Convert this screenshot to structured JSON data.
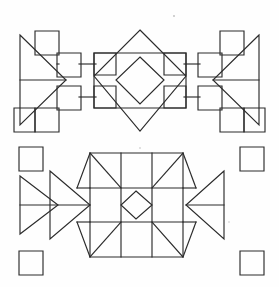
{
  "document": {
    "title": "Geometric Quilt Block Patterns",
    "width": 279,
    "height": 287,
    "background_color": "#fefefe",
    "ink_color": "#2b2b2b",
    "description": "Two line-drawn symmetric quilt block patterns stacked vertically on a plain white ground."
  },
  "figures": [
    {
      "id": "upper-block",
      "name": "Diamond-in-Square Block with Square Chains and Side Triangles",
      "symmetry": "bilateral left-right, bilateral top-bottom",
      "elements": [
        "central large diamond rotated square",
        "inner concentric diamond",
        "four corner squares of central panel",
        "ascending and descending chains of small squares on both flanks",
        "right-pointing triangle with horizontal midline at far left",
        "left-pointing triangle with horizontal midline at far right",
        "horizontal connector bars at upper and lower midlines"
      ]
    },
    {
      "id": "lower-block",
      "name": "Nine-Patch Star Block with Small Center Diamond",
      "symmetry": "bilateral left-right, bilateral top-bottom",
      "elements": [
        "three by three grid of square cells",
        "small diamond centered in middle cell",
        "diagonal lines across the four corner cells forming star points",
        "two nested right-pointing triangles at far left",
        "one left-pointing triangle with horizontal midline at far right",
        "four free-standing small squares at the outer corners"
      ]
    }
  ],
  "colors": {
    "ink": "#2b2b2b",
    "ink_soft": "#3a3a3a",
    "paper": "#fefefe",
    "speck": "#bdbdbd"
  },
  "chart_data": {
    "type": "diagram",
    "grid": false,
    "legend": false,
    "upper_block": {
      "center_diamond_outer": [
        [
          140,
          30
        ],
        [
          186,
          76
        ],
        [
          140,
          131
        ],
        [
          94,
          76
        ]
      ],
      "center_diamond_inner": [
        [
          140,
          56
        ],
        [
          165,
          80
        ],
        [
          140,
          105
        ],
        [
          115,
          80
        ]
      ],
      "center_panel": [
        94,
        53,
        92,
        55
      ],
      "corner_square_size": 22,
      "chain_square_size": 22,
      "left_triangle": [
        [
          20,
          35
        ],
        [
          66,
          80
        ],
        [
          20,
          125
        ]
      ],
      "right_triangle": [
        [
          259,
          35
        ],
        [
          213,
          80
        ],
        [
          259,
          125
        ]
      ],
      "midline_y": 80
    },
    "lower_block": {
      "grid_origin": [
        90,
        153
      ],
      "cell_size": 31,
      "grid_cells": 3,
      "center_diamond": [
        [
          136,
          184
        ],
        [
          152,
          205
        ],
        [
          136,
          226
        ],
        [
          120,
          205
        ]
      ],
      "left_triangle_outer": [
        [
          20,
          176
        ],
        [
          62,
          205
        ],
        [
          20,
          234
        ]
      ],
      "left_triangle_inner": [
        [
          52,
          172
        ],
        [
          90,
          205
        ],
        [
          52,
          238
        ]
      ],
      "right_triangle": [
        [
          244,
          172
        ],
        [
          206,
          205
        ],
        [
          244,
          238
        ]
      ],
      "corner_squares": [
        [
          20,
          148,
          23,
          23
        ],
        [
          238,
          148,
          23,
          23
        ],
        [
          20,
          250,
          23,
          23
        ],
        [
          238,
          250,
          23,
          23
        ]
      ],
      "midline_y": 205
    }
  }
}
